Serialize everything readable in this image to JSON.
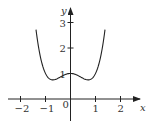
{
  "chart_data": {
    "type": "line",
    "title": "",
    "xlabel": "x",
    "ylabel": "y",
    "xlim": [
      -2.3,
      2.3
    ],
    "ylim": [
      -0.6,
      3.5
    ],
    "xticks": [
      -2,
      -1,
      0,
      1,
      2
    ],
    "xtick_labels": [
      "−2",
      "−1",
      "0",
      "1",
      "2"
    ],
    "yticks": [
      1,
      2,
      3
    ],
    "ytick_labels": [
      "1",
      "2",
      "3"
    ],
    "grid": false,
    "legend": null,
    "series": [
      {
        "name": "curve",
        "description": "even quartic-like function with local max at (0,1) and minima near (±0.7, 0.75)",
        "x": [
          -1.38,
          -1.3,
          -1.2,
          -1.1,
          -1.0,
          -0.9,
          -0.8,
          -0.707,
          -0.6,
          -0.5,
          -0.4,
          -0.3,
          -0.2,
          -0.1,
          0,
          0.1,
          0.2,
          0.3,
          0.4,
          0.5,
          0.6,
          0.707,
          0.8,
          0.9,
          1.0,
          1.1,
          1.2,
          1.3,
          1.38
        ],
        "values": [
          2.72,
          2.16,
          1.63,
          1.25,
          1.0,
          0.85,
          0.77,
          0.75,
          0.77,
          0.81,
          0.87,
          0.92,
          0.96,
          0.99,
          1.0,
          0.99,
          0.96,
          0.92,
          0.87,
          0.81,
          0.77,
          0.75,
          0.77,
          0.85,
          1.0,
          1.25,
          1.63,
          2.16,
          2.72
        ]
      }
    ]
  },
  "axes": {
    "x_label": "x",
    "y_label": "y",
    "origin_label": "0"
  }
}
